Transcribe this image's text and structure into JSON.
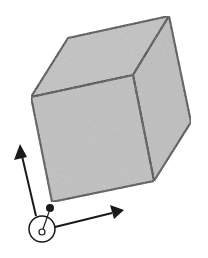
{
  "diagram": {
    "title": "",
    "colors": {
      "face_fill": "#b9b9b9",
      "stroke": "#1a1a1a",
      "background": "#ffffff"
    },
    "cube": {
      "vertices": {
        "top_back_left": [
          68,
          38
        ],
        "top_back_right": [
          169,
          16
        ],
        "top_front_left": [
          31,
          97
        ],
        "top_front_right": [
          133,
          75
        ],
        "bottom_front_left": [
          52,
          202
        ],
        "bottom_front_right": [
          154,
          181
        ],
        "bottom_back_right": [
          191,
          122
        ]
      }
    },
    "frame": {
      "origin_dot": [
        50,
        208
      ],
      "origin_circle": [
        42,
        229
      ],
      "y_axis_tip": [
        20,
        145
      ],
      "x_axis_tip": [
        124,
        210
      ]
    }
  }
}
